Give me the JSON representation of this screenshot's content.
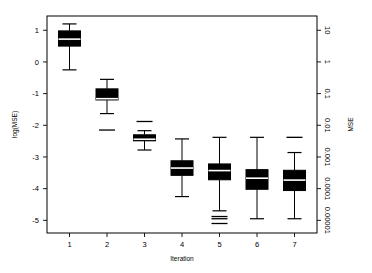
{
  "chart_data": {
    "type": "boxplot",
    "title": "",
    "xlabel": "Iteration",
    "ylabel": "log(MSE)",
    "ylabel_right": "MSE",
    "categories": [
      "1",
      "2",
      "3",
      "4",
      "5",
      "6",
      "7"
    ],
    "yticks": [
      "1",
      "0",
      "-1",
      "-2",
      "-3",
      "-4",
      "-5"
    ],
    "ytick_values": [
      1,
      0,
      -1,
      -2,
      -3,
      -4,
      -5
    ],
    "ylim": [
      -5.4,
      1.45
    ],
    "xlim": [
      0.4,
      7.6
    ],
    "yticks_right": [
      "10",
      "1",
      "0.1",
      "0.01",
      "0.001",
      "0.0001",
      "0.00001"
    ],
    "ytick_right_values": [
      10,
      1,
      0.1,
      0.01,
      0.001,
      0.0001,
      1e-05
    ],
    "grid": false,
    "legend": null,
    "box_color": "#000000",
    "median_color": "#ffffff",
    "axis_color": "#000000",
    "background": "#ffffff",
    "boxes": [
      {
        "category": "1",
        "whisker_high": 1.2,
        "q3": 0.98,
        "median": 0.72,
        "q1": 0.5,
        "whisker_low": -0.25,
        "outliers": []
      },
      {
        "category": "2",
        "whisker_high": -0.55,
        "q3": -0.85,
        "median": -1.16,
        "q1": -1.2,
        "whisker_low": -1.63,
        "outliers": [
          -2.15
        ]
      },
      {
        "category": "3",
        "whisker_high": -2.17,
        "q3": -2.3,
        "median": -2.44,
        "q1": -2.49,
        "whisker_low": -2.78,
        "outliers": [
          -1.88
        ]
      },
      {
        "category": "4",
        "whisker_high": -2.43,
        "q3": -3.12,
        "median": -3.35,
        "q1": -3.58,
        "whisker_low": -4.25,
        "outliers": []
      },
      {
        "category": "5",
        "whisker_high": -2.38,
        "q3": -3.22,
        "median": -3.43,
        "q1": -3.72,
        "whisker_low": -4.7,
        "outliers": [
          -4.88,
          -4.95,
          -5.1
        ]
      },
      {
        "category": "6",
        "whisker_high": -2.38,
        "q3": -3.4,
        "median": -3.67,
        "q1": -4.02,
        "whisker_low": -4.95,
        "outliers": []
      },
      {
        "category": "7",
        "whisker_high": -2.86,
        "q3": -3.42,
        "median": -3.73,
        "q1": -4.06,
        "whisker_low": -4.95,
        "outliers": [
          -2.38
        ]
      }
    ]
  }
}
